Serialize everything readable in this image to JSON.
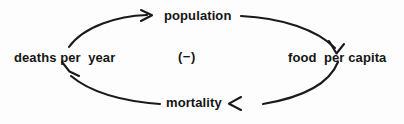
{
  "diagram": {
    "kind": "causal-loop-diagram",
    "title": "",
    "background_color": "#fdfdfd",
    "stroke_color": "#1a1a1a",
    "text_color": "#151515",
    "polarity_label": "(−)",
    "nodes": [
      {
        "id": "population",
        "label": "population",
        "position": "top"
      },
      {
        "id": "food-per-capita",
        "label": "food  per capita",
        "position": "right"
      },
      {
        "id": "mortality",
        "label": "mortality",
        "position": "bottom"
      },
      {
        "id": "deaths-per-year",
        "label": "deaths per  year",
        "position": "left"
      }
    ],
    "links": [
      {
        "id": "population-to-food",
        "from": "population",
        "to": "food-per-capita",
        "arrow": "into-food-per-capita"
      },
      {
        "id": "food-to-mortality",
        "from": "food-per-capita",
        "to": "mortality",
        "arrow": "into-mortality"
      },
      {
        "id": "mortality-to-deaths",
        "from": "mortality",
        "to": "deaths-per-year",
        "arrow": "into-deaths-per-year"
      },
      {
        "id": "deaths-to-population",
        "from": "deaths-per-year",
        "to": "population",
        "arrow": "into-population"
      }
    ]
  }
}
